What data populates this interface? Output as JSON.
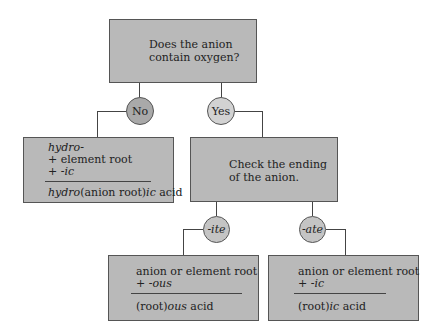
{
  "nodes": {
    "question": {
      "line1": "Does the anion",
      "line2": "contain oxygen?"
    },
    "no_label": "No",
    "yes_label": "Yes",
    "hydro_box": {
      "prefix": "hydro-",
      "plus_root": "+ element root",
      "plus_ic_plus": "+ ",
      "plus_ic_suffix": "-ic",
      "result_prefix": "hydro",
      "result_middle": "(anion root)",
      "result_suffix": "ic",
      "result_acid": " acid"
    },
    "check_box": {
      "line1": "Check the ending",
      "line2": "of the anion."
    },
    "ite_label": "-ite",
    "ate_label": "-ate",
    "ous_box": {
      "line1": "anion or element root",
      "plus": "+ ",
      "suffix": "-ous",
      "result_root": "(root)",
      "result_suffix": "ous",
      "result_acid": " acid"
    },
    "ic_box": {
      "line1": "anion or element root",
      "plus": "+ ",
      "suffix": "-ic",
      "result_root": "(root)",
      "result_suffix": "ic",
      "result_acid": " acid"
    }
  },
  "colors": {
    "box": "#b9b9b9",
    "no_circle": "#a9a9a9",
    "yes_circle": "#d2d2d2",
    "line": "#444444"
  }
}
